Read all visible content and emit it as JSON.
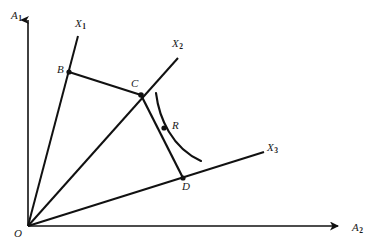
{
  "figure": {
    "type": "geometric-diagram",
    "background_color": "#ffffff",
    "stroke_color": "#111111",
    "axes": {
      "vertical": {
        "label": "A",
        "subscript": "1",
        "from": [
          28,
          226
        ],
        "to": [
          28,
          14
        ]
      },
      "horizontal": {
        "label": "A",
        "subscript": "2",
        "from": [
          28,
          226
        ],
        "to": [
          345,
          226
        ]
      }
    },
    "origin": {
      "label": "O",
      "x": 28,
      "y": 226
    },
    "rays": [
      {
        "name": "X1",
        "label": "X",
        "subscript": "1",
        "from": [
          28,
          226
        ],
        "to": [
          78,
          36
        ],
        "tip_label_x": 75,
        "tip_label_y": 18
      },
      {
        "name": "X2",
        "label": "X",
        "subscript": "2",
        "from": [
          28,
          226
        ],
        "to": [
          178,
          58
        ],
        "tip_label_x": 172,
        "tip_label_y": 38
      },
      {
        "name": "X3",
        "label": "X",
        "subscript": "3",
        "from": [
          28,
          226
        ],
        "to": [
          264,
          152
        ],
        "tip_label_x": 267,
        "tip_label_y": 142
      }
    ],
    "points": [
      {
        "label": "B",
        "x": 69,
        "y": 72,
        "label_x": 57,
        "label_y": 64
      },
      {
        "label": "C",
        "x": 141,
        "y": 95,
        "label_x": 131,
        "label_y": 78
      },
      {
        "label": "R",
        "x": 164,
        "y": 128,
        "label_x": 172,
        "label_y": 120
      },
      {
        "label": "D",
        "x": 183,
        "y": 178,
        "label_x": 182,
        "label_y": 180
      }
    ],
    "segments": [
      {
        "name": "segment-B-C",
        "from": [
          69,
          72
        ],
        "to": [
          141,
          95
        ]
      },
      {
        "name": "segment-C-D",
        "from": [
          141,
          95
        ],
        "to": [
          183,
          178
        ]
      }
    ],
    "curve": {
      "name": "isoquant-curve-through-R",
      "start": [
        156,
        93
      ],
      "control1": [
        159,
        118
      ],
      "control2": [
        172,
        148
      ],
      "end": [
        201,
        161
      ]
    }
  }
}
